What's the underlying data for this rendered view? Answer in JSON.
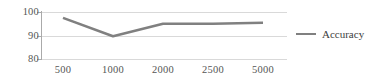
{
  "chart_data": {
    "type": "line",
    "title": "",
    "xlabel": "",
    "ylabel": "",
    "categories": [
      "500",
      "1000",
      "2000",
      "2500",
      "5000"
    ],
    "x": [
      500,
      1000,
      2000,
      2500,
      5000
    ],
    "series": [
      {
        "name": "Accuracy",
        "values": [
          97.5,
          89.7,
          95.0,
          95.0,
          95.4
        ],
        "color": "#808080"
      }
    ],
    "ylim": [
      80,
      100
    ],
    "yticks": [
      80,
      90,
      100
    ],
    "ytick_labels": [
      "80",
      "90",
      "100"
    ],
    "grid": true,
    "legend": {
      "position": "right",
      "entries": [
        "Accuracy"
      ]
    }
  },
  "axes": {
    "y": {
      "t100": "100",
      "t90": "90",
      "t80": "80"
    },
    "x": {
      "t1": "500",
      "t2": "1000",
      "t3": "2000",
      "t4": "2500",
      "t5": "5000"
    }
  },
  "legend": {
    "accuracy_label": "Accuracy"
  },
  "colors": {
    "series": "#808080",
    "grid": "#d9d9d9",
    "axis": "#aaaaaa",
    "text": "#555555",
    "background": "#ffffff"
  }
}
